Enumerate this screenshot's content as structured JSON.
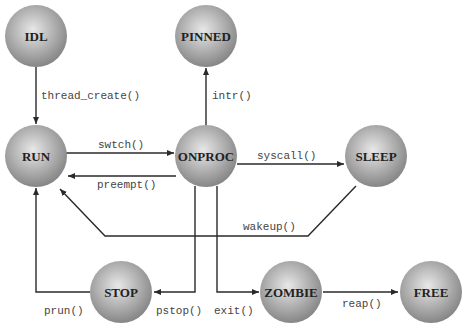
{
  "diagram": {
    "type": "state-transition",
    "nodes": [
      {
        "id": "IDL",
        "label": "IDL",
        "cx": 36,
        "cy": 36
      },
      {
        "id": "PINNED",
        "label": "PINNED",
        "cx": 206,
        "cy": 36
      },
      {
        "id": "RUN",
        "label": "RUN",
        "cx": 36,
        "cy": 156
      },
      {
        "id": "ONPROC",
        "label": "ONPROC",
        "cx": 206,
        "cy": 156
      },
      {
        "id": "SLEEP",
        "label": "SLEEP",
        "cx": 376,
        "cy": 156
      },
      {
        "id": "STOP",
        "label": "STOP",
        "cx": 121,
        "cy": 292
      },
      {
        "id": "ZOMBIE",
        "label": "ZOMBIE",
        "cx": 291,
        "cy": 292
      },
      {
        "id": "FREE",
        "label": "FREE",
        "cx": 431,
        "cy": 292
      }
    ],
    "edges": [
      {
        "from": "IDL",
        "to": "RUN",
        "label": "thread_create()"
      },
      {
        "from": "ONPROC",
        "to": "PINNED",
        "label": "intr()"
      },
      {
        "from": "RUN",
        "to": "ONPROC",
        "label": "swtch()"
      },
      {
        "from": "ONPROC",
        "to": "RUN",
        "label": "preempt()"
      },
      {
        "from": "ONPROC",
        "to": "SLEEP",
        "label": "syscall()"
      },
      {
        "from": "SLEEP",
        "to": "RUN",
        "label": "wakeup()"
      },
      {
        "from": "ONPROC",
        "to": "STOP",
        "label": "pstop()"
      },
      {
        "from": "STOP",
        "to": "RUN",
        "label": "prun()"
      },
      {
        "from": "ONPROC",
        "to": "ZOMBIE",
        "label": "exit()"
      },
      {
        "from": "ZOMBIE",
        "to": "FREE",
        "label": "reap()"
      }
    ]
  },
  "labels": {
    "idl": "IDL",
    "pinned": "PINNED",
    "run": "RUN",
    "onproc": "ONPROC",
    "sleep": "SLEEP",
    "stop": "STOP",
    "zombie": "ZOMBIE",
    "free": "FREE",
    "thread_create": "thread_create()",
    "intr": "intr()",
    "swtch": "swtch()",
    "preempt": "preempt()",
    "syscall": "syscall()",
    "wakeup": "wakeup()",
    "pstop": "pstop()",
    "prun": "prun()",
    "exit": "exit()",
    "reap": "reap()"
  },
  "colors": {
    "sphere_highlight": "#e6e6e6",
    "sphere_shadow": "#8a8a8a",
    "edge": "#2a2a2a"
  }
}
